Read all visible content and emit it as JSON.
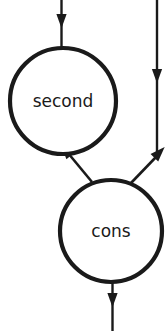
{
  "canvas": {
    "width": 167,
    "height": 331,
    "background": "#ffffff",
    "stroke_color": "#1a1a1a",
    "text_color": "#1a1a1a"
  },
  "diagram": {
    "type": "node-and-arrow-graph",
    "nodes": [
      {
        "id": "second",
        "label": "second",
        "shape": "circle",
        "cx": 63,
        "cy": 101,
        "r": 53,
        "stroke_width": 4.2,
        "font_size": 17,
        "label_x": 63,
        "label_y": 102
      },
      {
        "id": "cons",
        "label": "cons",
        "shape": "circle",
        "cx": 111,
        "cy": 231,
        "r": 51,
        "stroke_width": 4.2,
        "font_size": 17,
        "label_x": 111,
        "label_y": 232
      }
    ],
    "edges": [
      {
        "id": "edge-top-into-second",
        "from": "top-boundary",
        "to": "second",
        "direction": "down",
        "stroke_width": 2.4,
        "path": "M 61.5 0 L 61.5 48",
        "arrow_at": {
          "x": 61.5,
          "y": 17,
          "angle_deg": 90
        },
        "arrow_size": 5.4
      },
      {
        "id": "edge-cons-to-second",
        "from": "cons",
        "to": "second",
        "direction": "up-left",
        "stroke_width": 2.6,
        "path": "M 92 182 L 68 153",
        "arrow_at": {
          "x": 68.5,
          "y": 153.5,
          "angle_deg": 230
        },
        "arrow_size": 5.6
      },
      {
        "id": "edge-cons-to-right-channel",
        "from": "cons",
        "to": "right-channel",
        "direction": "up-right",
        "stroke_width": 2.6,
        "path": "M 131 183 L 157 156",
        "arrow_at": {
          "x": 156.5,
          "y": 155.5,
          "angle_deg": -46
        },
        "arrow_size": 5.6
      },
      {
        "id": "edge-right-channel-vertical",
        "from": "top-boundary-right",
        "to": "right-channel-end",
        "direction": "down",
        "stroke_width": 2.4,
        "path": "M 157 0 L 157 156",
        "arrow_at": {
          "x": 157,
          "y": 72,
          "angle_deg": 90
        },
        "arrow_size": 5.4
      },
      {
        "id": "edge-cons-out-bottom",
        "from": "cons",
        "to": "bottom-boundary",
        "direction": "down",
        "stroke_width": 2.4,
        "path": "M 112.5 282 L 112.5 331",
        "arrow_at": {
          "x": 112.5,
          "y": 296,
          "angle_deg": 90
        },
        "arrow_size": 5.4
      }
    ]
  }
}
